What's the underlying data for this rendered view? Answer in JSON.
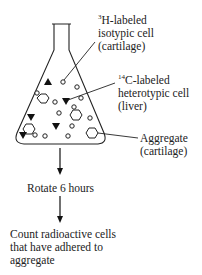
{
  "labels": {
    "isotypic": {
      "sup": "3",
      "line1": "H-labeled",
      "line2": "isotypic cell",
      "line3": "(cartilage)"
    },
    "heterotypic": {
      "sup": "14",
      "line1": "C-labeled",
      "line2": "heterotypic cell",
      "line3": "(liver)"
    },
    "aggregate": {
      "line1": "Aggregate",
      "line2": "(cartilage)"
    }
  },
  "steps": {
    "rotate": "Rotate 6 hours",
    "count_line1": "Count radioactive cells",
    "count_line2": "that have adhered to",
    "count_line3": "aggregate"
  },
  "legend_shapes": {
    "isotypic": "small open circle",
    "heterotypic": "filled triangle",
    "aggregate": "open hexagon"
  }
}
